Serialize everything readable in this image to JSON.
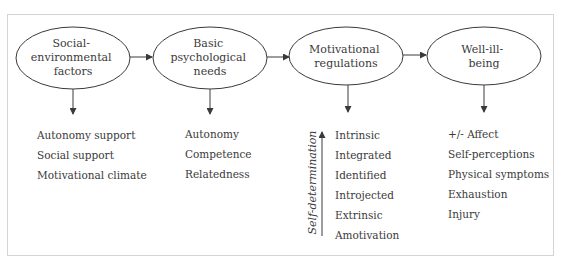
{
  "nodes": [
    {
      "id": "social-environmental-factors",
      "lines": [
        "Social-",
        "environmental",
        "factors"
      ]
    },
    {
      "id": "basic-psychological-needs",
      "lines": [
        "Basic",
        "psychological",
        "needs"
      ]
    },
    {
      "id": "motivational-regulations",
      "lines": [
        "Motivational",
        "regulations"
      ]
    },
    {
      "id": "well-ill-being",
      "lines": [
        "Well-ill-",
        "being"
      ]
    }
  ],
  "edges": [
    {
      "from": "social-environmental-factors",
      "to": "basic-psychological-needs"
    },
    {
      "from": "basic-psychological-needs",
      "to": "motivational-regulations"
    },
    {
      "from": "motivational-regulations",
      "to": "well-ill-being"
    }
  ],
  "lists": {
    "social_environmental_factors": [
      "Autonomy support",
      "Social support",
      "Motivational climate"
    ],
    "basic_psychological_needs": [
      "Autonomy",
      "Competence",
      "Relatedness"
    ],
    "motivational_regulations": [
      "Intrinsic",
      "Integrated",
      "Identified",
      "Introjected",
      "Extrinsic",
      "Amotivation"
    ],
    "well_ill_being": [
      "+/- Affect",
      "Self-perceptions",
      "Physical symptoms",
      "Exhaustion",
      "Injury"
    ]
  },
  "axis": {
    "label": "Self-determination",
    "direction": "up"
  },
  "colors": {
    "stroke": "#3a3a3a",
    "text": "#3a3a3a",
    "frame": "#d4d4d4"
  }
}
